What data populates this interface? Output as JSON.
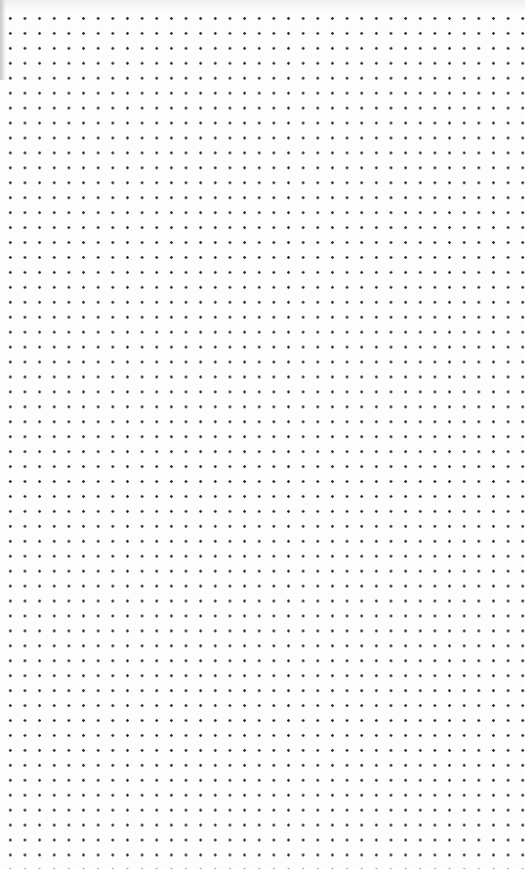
{
  "page": {
    "type": "dot-grid paper",
    "background_color": "#fdfdfd",
    "dot_color": "#2a2a2a",
    "dot_spacing_x": 14.65,
    "dot_spacing_y": 14.95,
    "columns": 35,
    "rows": 57
  }
}
